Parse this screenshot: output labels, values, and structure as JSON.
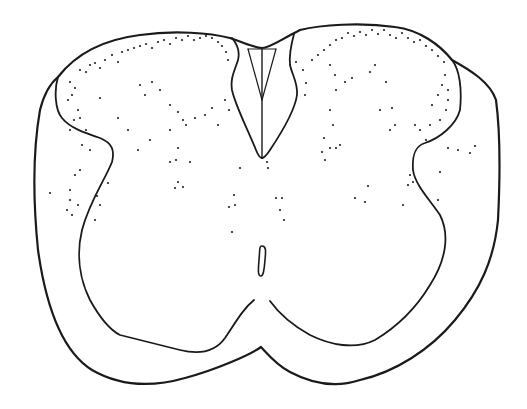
{
  "figure": {
    "width": 527,
    "height": 409,
    "background": "#ffffff",
    "stroke_color": "#1a1a1a",
    "dot_color": "#222222",
    "paths": {
      "outer_contour": "M 261 347 C 250 355 215 370 185 378 C 150 388 118 385 92 370 C 60 350 45 300 38 250 C 33 200 33 150 40 110 C 45 90 52 82 58 77 C 75 55 100 40 140 35 C 175 30 210 33 230 38 C 245 43 255 48 262 48 C 270 48 280 40 300 30 C 320 25 360 22 395 27 C 420 30 440 45 452 60 C 470 70 490 82 496 100 C 500 130 500 180 498 220 C 494 260 480 290 455 320 C 430 350 395 372 360 380 C 330 390 305 380 290 372 C 275 364 266 352 261 347 Z",
      "left_gray_boundary": "M 58 77 C 54 90 55 110 62 118 C 70 128 85 133 100 138 C 112 143 115 150 112 162 C 105 180 90 200 82 230 C 76 255 80 280 90 300 C 100 318 110 330 120 335 C 140 340 160 345 180 350 C 200 355 215 352 225 338 C 237 320 244 308 254 300",
      "right_gray_boundary": "M 452 60 C 460 70 462 90 460 110 C 456 125 440 138 425 143 C 415 146 412 155 413 170 C 415 185 430 200 440 215 C 450 235 446 260 430 285 C 418 305 400 325 375 340 C 355 350 330 345 310 335 C 292 325 280 315 270 301",
      "left_dorsal_horn_edge": "M 232 38 C 238 45 240 52 238 60 C 235 70 230 78 232 90 C 235 105 248 130 256 150 C 258 155 260 158 262 158",
      "right_dorsal_horn_edge": "M 294 34 C 291 45 289 55 290 65 C 292 75 298 82 297 95 C 295 110 280 135 270 150 C 266 156 264 158 262 158",
      "dorsal_septum_left": "M 248 49 L 262 100",
      "dorsal_septum_right": "M 276 49 L 262 100",
      "dorsal_septum_top": "M 248 49 L 276 49",
      "dorsal_median_septum": "M 262 49 L 262 158",
      "central_canal": "M 262 246 C 266 246 266 250 265 260 C 264 272 263 276 261 276 C 258 276 258 272 259 260 C 260 250 259 246 262 246 Z"
    },
    "dots": [
      [
        70,
        82
      ],
      [
        75,
        88
      ],
      [
        80,
        70
      ],
      [
        86,
        72
      ],
      [
        90,
        65
      ],
      [
        95,
        63
      ],
      [
        100,
        68
      ],
      [
        105,
        60
      ],
      [
        112,
        55
      ],
      [
        118,
        62
      ],
      [
        122,
        52
      ],
      [
        128,
        50
      ],
      [
        134,
        48
      ],
      [
        140,
        46
      ],
      [
        146,
        44
      ],
      [
        152,
        48
      ],
      [
        158,
        42
      ],
      [
        164,
        40
      ],
      [
        170,
        44
      ],
      [
        176,
        38
      ],
      [
        182,
        40
      ],
      [
        188,
        36
      ],
      [
        194,
        40
      ],
      [
        200,
        38
      ],
      [
        206,
        36
      ],
      [
        212,
        38
      ],
      [
        218,
        42
      ],
      [
        222,
        46
      ],
      [
        226,
        52
      ],
      [
        228,
        60
      ],
      [
        72,
        95
      ],
      [
        78,
        110
      ],
      [
        68,
        100
      ],
      [
        74,
        120
      ],
      [
        80,
        118
      ],
      [
        70,
        130
      ],
      [
        86,
        130
      ],
      [
        82,
        145
      ],
      [
        90,
        150
      ],
      [
        100,
        98
      ],
      [
        118,
        118
      ],
      [
        128,
        130
      ],
      [
        138,
        150
      ],
      [
        150,
        140
      ],
      [
        170,
        130
      ],
      [
        178,
        148
      ],
      [
        183,
        120
      ],
      [
        195,
        118
      ],
      [
        205,
        115
      ],
      [
        212,
        108
      ],
      [
        218,
        125
      ],
      [
        225,
        100
      ],
      [
        229,
        110
      ],
      [
        140,
        85
      ],
      [
        145,
        95
      ],
      [
        152,
        82
      ],
      [
        160,
        90
      ],
      [
        170,
        105
      ],
      [
        178,
        112
      ],
      [
        186,
        125
      ],
      [
        170,
        162
      ],
      [
        176,
        160
      ],
      [
        178,
        182
      ],
      [
        190,
        162
      ],
      [
        175,
        188
      ],
      [
        183,
        187
      ],
      [
        80,
        170
      ],
      [
        75,
        175
      ],
      [
        70,
        190
      ],
      [
        70,
        200
      ],
      [
        67,
        210
      ],
      [
        72,
        215
      ],
      [
        78,
        205
      ],
      [
        50,
        193
      ],
      [
        100,
        205
      ],
      [
        95,
        220
      ],
      [
        97,
        196
      ],
      [
        108,
        183
      ],
      [
        240,
        168
      ],
      [
        267,
        162
      ],
      [
        268,
        168
      ],
      [
        234,
        195
      ],
      [
        235,
        205
      ],
      [
        229,
        207
      ],
      [
        276,
        198
      ],
      [
        282,
        198
      ],
      [
        280,
        210
      ],
      [
        284,
        220
      ],
      [
        232,
        232
      ],
      [
        305,
        95
      ],
      [
        306,
        83
      ],
      [
        303,
        70
      ],
      [
        296,
        62
      ],
      [
        312,
        60
      ],
      [
        318,
        55
      ],
      [
        324,
        50
      ],
      [
        330,
        45
      ],
      [
        336,
        40
      ],
      [
        342,
        38
      ],
      [
        348,
        33
      ],
      [
        354,
        36
      ],
      [
        360,
        32
      ],
      [
        366,
        35
      ],
      [
        372,
        30
      ],
      [
        378,
        34
      ],
      [
        384,
        30
      ],
      [
        390,
        35
      ],
      [
        396,
        38
      ],
      [
        402,
        33
      ],
      [
        408,
        38
      ],
      [
        414,
        42
      ],
      [
        420,
        40
      ],
      [
        426,
        46
      ],
      [
        432,
        50
      ],
      [
        438,
        56
      ],
      [
        444,
        62
      ],
      [
        330,
        65
      ],
      [
        335,
        75
      ],
      [
        345,
        82
      ],
      [
        352,
        78
      ],
      [
        370,
        72
      ],
      [
        375,
        65
      ],
      [
        386,
        82
      ],
      [
        330,
        110
      ],
      [
        333,
        125
      ],
      [
        336,
        90
      ],
      [
        380,
        110
      ],
      [
        392,
        108
      ],
      [
        395,
        125
      ],
      [
        390,
        130
      ],
      [
        324,
        138
      ],
      [
        330,
        148
      ],
      [
        336,
        148
      ],
      [
        340,
        145
      ],
      [
        322,
        152
      ],
      [
        325,
        160
      ],
      [
        415,
        125
      ],
      [
        420,
        130
      ],
      [
        426,
        140
      ],
      [
        430,
        125
      ],
      [
        432,
        105
      ],
      [
        438,
        95
      ],
      [
        442,
        85
      ],
      [
        445,
        75
      ],
      [
        448,
        100
      ],
      [
        446,
        110
      ],
      [
        440,
        120
      ],
      [
        448,
        90
      ],
      [
        410,
        175
      ],
      [
        408,
        185
      ],
      [
        413,
        182
      ],
      [
        403,
        205
      ],
      [
        440,
        172
      ],
      [
        438,
        200
      ],
      [
        448,
        148
      ],
      [
        458,
        150
      ],
      [
        470,
        153
      ],
      [
        475,
        146
      ],
      [
        355,
        198
      ],
      [
        368,
        186
      ],
      [
        365,
        202
      ]
    ]
  }
}
